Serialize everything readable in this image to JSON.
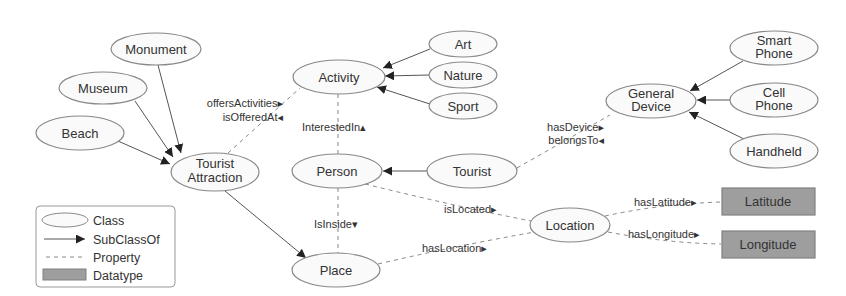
{
  "diagram": {
    "classes": {
      "monument": "Monument",
      "museum": "Museum",
      "beach": "Beach",
      "tourist_attraction": [
        "Tourist",
        "Attraction"
      ],
      "activity": "Activity",
      "art": "Art",
      "nature": "Nature",
      "sport": "Sport",
      "person": "Person",
      "tourist": "Tourist",
      "general_device": [
        "General",
        "Device"
      ],
      "smart_phone": [
        "Smart",
        "Phone"
      ],
      "cell_phone": [
        "Cell",
        "Phone"
      ],
      "handheld": "Handheld",
      "location": "Location",
      "place": "Place"
    },
    "datatypes": {
      "latitude": "Latitude",
      "longitude": "Longitude"
    },
    "properties": {
      "offers_activities": "offersActivities▸",
      "is_offered_at": "isOfferedAt◂",
      "interested_in": "InterestedIn▴",
      "has_device": "hasDevice▸",
      "belongs_to": "belongsTo◂",
      "is_located": "isLocated▸",
      "is_inside": "IsInside▾",
      "has_location": "hasLocation▸",
      "has_latitude": "hasLatitude▸",
      "has_longitude": "hasLongitude▸"
    },
    "subclass_edges": [
      {
        "from": "Monument",
        "to": "Tourist Attraction"
      },
      {
        "from": "Museum",
        "to": "Tourist Attraction"
      },
      {
        "from": "Beach",
        "to": "Tourist Attraction"
      },
      {
        "from": "Art",
        "to": "Activity"
      },
      {
        "from": "Nature",
        "to": "Activity"
      },
      {
        "from": "Sport",
        "to": "Activity"
      },
      {
        "from": "Tourist",
        "to": "Person"
      },
      {
        "from": "Smart Phone",
        "to": "General Device"
      },
      {
        "from": "Cell Phone",
        "to": "General Device"
      },
      {
        "from": "Handheld",
        "to": "General Device"
      },
      {
        "from": "Tourist Attraction",
        "to": "Place"
      }
    ]
  },
  "legend": {
    "class": "Class",
    "subclass_of": "SubClassOf",
    "property": "Property",
    "datatype": "Datatype"
  },
  "colors": {
    "node_fill": "#fafafa",
    "node_stroke": "#888888",
    "datatype_fill": "#9e9e9e",
    "edge": "#555555",
    "text": "#333333"
  }
}
